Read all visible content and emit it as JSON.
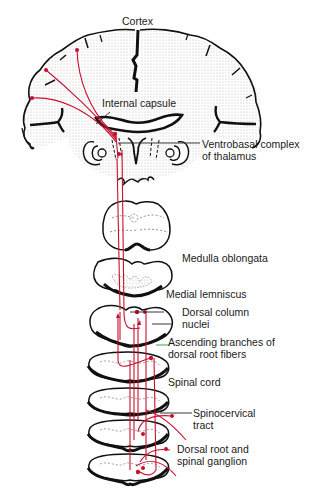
{
  "figure": {
    "type": "anatomical-diagram",
    "pathway_color": "#c8102e",
    "outline_color": "#111111",
    "stipple_color": "#bbbbbb"
  },
  "labels": {
    "cortex": "Cortex",
    "internal_capsule": "Internal capsule",
    "ventrobasal_line1": "Ventrobasal complex",
    "ventrobasal_line2": "of thalamus",
    "medulla": "Medulla oblongata",
    "medial_lemniscus": "Medial lemniscus",
    "dorsal_column_line1": "Dorsal column",
    "dorsal_column_line2": "nuclei",
    "ascending_line1": "Ascending branches of",
    "ascending_line2": "dorsal root fibers",
    "spinal_cord": "Spinal cord",
    "spinocervical_line1": "Spinocervical",
    "spinocervical_line2": "tract",
    "dorsal_root_line1": "Dorsal root and",
    "dorsal_root_line2": "spinal ganglion"
  },
  "structures": [
    "cerebral-cortex",
    "internal-capsule",
    "thalamus",
    "midbrain-section",
    "pons-section",
    "medulla-section",
    "lower-medulla-section",
    "spinal-cord-section-1",
    "spinal-cord-section-2",
    "spinal-cord-section-3",
    "spinal-cord-section-4"
  ]
}
